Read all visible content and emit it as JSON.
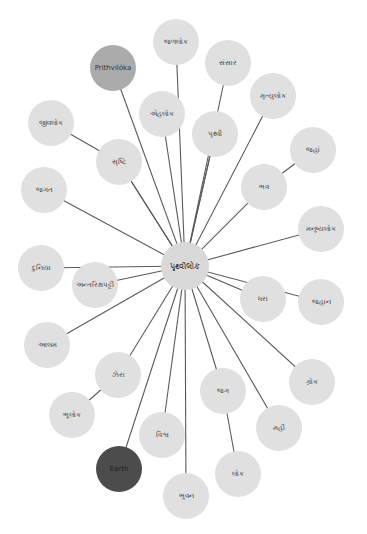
{
  "graph": {
    "colors": {
      "node_default": "#e0e0e0",
      "node_highlight_light": "#ababab",
      "node_highlight_dark": "#4c4c4c",
      "edge": "#5a5a5a",
      "background": "#ffffff"
    },
    "center": {
      "id": "c",
      "label": "પૃથ્વીલોક",
      "x": 185,
      "y": 266,
      "r": 24
    },
    "nodes": [
      {
        "id": "n1",
        "label": "જળલોક",
        "x": 176,
        "y": 42,
        "r": 23,
        "style": "default"
      },
      {
        "id": "n2",
        "label": "સંસાર",
        "x": 228,
        "y": 63,
        "r": 23,
        "style": "default"
      },
      {
        "id": "n3",
        "label": "Prithvilóka",
        "x": 113,
        "y": 68,
        "r": 23,
        "style": "light"
      },
      {
        "id": "n4",
        "label": "મૃત્યુલોક",
        "x": 273,
        "y": 96,
        "r": 23,
        "style": "default"
      },
      {
        "id": "n5",
        "label": "એહલોક",
        "x": 162,
        "y": 114,
        "r": 23,
        "style": "default"
      },
      {
        "id": "n6",
        "label": "પૃથ્વી",
        "x": 215,
        "y": 134,
        "r": 23,
        "style": "default"
      },
      {
        "id": "n7",
        "label": "જીવલોક",
        "x": 51,
        "y": 123,
        "r": 23,
        "style": "default"
      },
      {
        "id": "n8",
        "label": "જહાં",
        "x": 313,
        "y": 150,
        "r": 23,
        "style": "default"
      },
      {
        "id": "n9",
        "label": "સૃષ્ટિ",
        "x": 119,
        "y": 162,
        "r": 23,
        "style": "default"
      },
      {
        "id": "n10",
        "label": "ભવ",
        "x": 264,
        "y": 187,
        "r": 23,
        "style": "default"
      },
      {
        "id": "n11",
        "label": "જગત",
        "x": 44,
        "y": 190,
        "r": 23,
        "style": "default"
      },
      {
        "id": "n12",
        "label": "મનુષ્યલોક",
        "x": 321,
        "y": 229,
        "r": 23,
        "style": "default"
      },
      {
        "id": "n13",
        "label": "દુનિયા",
        "x": 41,
        "y": 268,
        "r": 23,
        "style": "default"
      },
      {
        "id": "n14",
        "label": "અન્તરિક્ષપટ્ટી",
        "x": 95,
        "y": 285,
        "r": 23,
        "style": "default"
      },
      {
        "id": "n15",
        "label": "ધરા",
        "x": 263,
        "y": 299,
        "r": 23,
        "style": "default"
      },
      {
        "id": "n16",
        "label": "જહાન",
        "x": 321,
        "y": 302,
        "r": 23,
        "style": "default"
      },
      {
        "id": "n17",
        "label": "આલમ",
        "x": 47,
        "y": 345,
        "r": 23,
        "style": "default"
      },
      {
        "id": "n18",
        "label": "ઝેરા",
        "x": 118,
        "y": 375,
        "r": 23,
        "style": "default"
      },
      {
        "id": "n19",
        "label": "ગ્રોક",
        "x": 312,
        "y": 382,
        "r": 23,
        "style": "default"
      },
      {
        "id": "n20",
        "label": "જગ",
        "x": 223,
        "y": 391,
        "r": 23,
        "style": "default"
      },
      {
        "id": "n21",
        "label": "ભૂલોક",
        "x": 72,
        "y": 415,
        "r": 23,
        "style": "default"
      },
      {
        "id": "n22",
        "label": "મહી",
        "x": 279,
        "y": 428,
        "r": 23,
        "style": "default"
      },
      {
        "id": "n23",
        "label": "વિશ્વ",
        "x": 162,
        "y": 435,
        "r": 23,
        "style": "default"
      },
      {
        "id": "n24",
        "label": "Earth",
        "x": 119,
        "y": 469,
        "r": 23,
        "style": "dark"
      },
      {
        "id": "n25",
        "label": "લોક",
        "x": 238,
        "y": 474,
        "r": 23,
        "style": "default"
      },
      {
        "id": "n26",
        "label": "ભુવન",
        "x": 186,
        "y": 496,
        "r": 23,
        "style": "default"
      }
    ],
    "edges": [
      [
        "c",
        "n1"
      ],
      [
        "c",
        "n2"
      ],
      [
        "c",
        "n3"
      ],
      [
        "c",
        "n4"
      ],
      [
        "c",
        "n5"
      ],
      [
        "c",
        "n6"
      ],
      [
        "c",
        "n9"
      ],
      [
        "c",
        "n10"
      ],
      [
        "c",
        "n11"
      ],
      [
        "c",
        "n12"
      ],
      [
        "c",
        "n13"
      ],
      [
        "c",
        "n14"
      ],
      [
        "c",
        "n15"
      ],
      [
        "c",
        "n16"
      ],
      [
        "c",
        "n17"
      ],
      [
        "c",
        "n18"
      ],
      [
        "c",
        "n19"
      ],
      [
        "c",
        "n20"
      ],
      [
        "c",
        "n22"
      ],
      [
        "c",
        "n23"
      ],
      [
        "c",
        "n24"
      ],
      [
        "c",
        "n26"
      ],
      [
        "n7",
        "n9"
      ],
      [
        "n8",
        "n10"
      ],
      [
        "n21",
        "n18"
      ],
      [
        "n20",
        "n25"
      ],
      [
        "c",
        "n6"
      ],
      [
        "c",
        "n9"
      ]
    ]
  }
}
